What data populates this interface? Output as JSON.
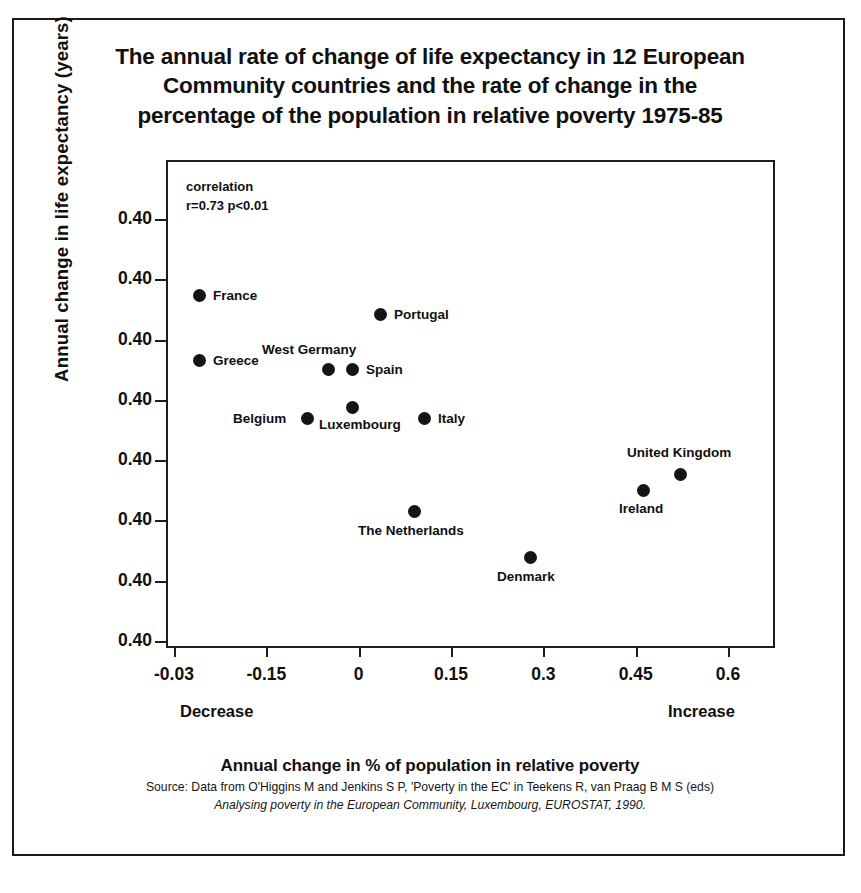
{
  "chart_data": {
    "type": "scatter",
    "title": "The annual rate of change of life expectancy in 12 European Community countries and the rate of change in the percentage of the population in relative poverty 1975-85",
    "title_lines": [
      "The annual rate of change of life expectancy in 12 European",
      "Community countries and the rate of change in the",
      "percentage of the population in relative poverty 1975-85"
    ],
    "xlabel": "Annual change in % of population in relative poverty",
    "ylabel": "Annual change in life expectancy (years)",
    "xlim": [
      -0.3,
      0.6
    ],
    "ylim": [
      0,
      0.4
    ],
    "grid": false,
    "legend": null,
    "x_tick_labels": [
      "-0.03",
      "-0.15",
      "0",
      "0.15",
      "0.3",
      "0.45",
      "0.6"
    ],
    "x_tick_values": [
      -0.3,
      -0.15,
      0,
      0.15,
      0.3,
      0.45,
      0.6
    ],
    "y_tick_labels": [
      "0.40",
      "0.40",
      "0.40",
      "0.40",
      "0.40",
      "0.40",
      "0.40",
      "0.40"
    ],
    "x_direction_low": "Decrease",
    "x_direction_high": "Increase",
    "annotations": {
      "correlation_line1": "correlation",
      "correlation_line2": "r=0.73 p<0.01",
      "correlation_r": 0.73,
      "correlation_p": "p<0.01"
    },
    "points": [
      {
        "label": "France",
        "x": -0.222,
        "y": 0.321,
        "px": 199,
        "py": 295,
        "label_dx": 14,
        "label_dy": -6
      },
      {
        "label": "Greece",
        "x": -0.222,
        "y": 0.268,
        "px": 199,
        "py": 360,
        "label_dx": 14,
        "label_dy": -6
      },
      {
        "label": "Portugal",
        "x": 0.045,
        "y": 0.305,
        "px": 380,
        "py": 314,
        "label_dx": 14,
        "label_dy": -6
      },
      {
        "label": "West Germany",
        "x": -0.045,
        "y": 0.261,
        "px": 328,
        "py": 369,
        "label_dx": -66,
        "label_dy": -26
      },
      {
        "label": "Spain",
        "x": -0.009,
        "y": 0.261,
        "px": 352,
        "py": 369,
        "label_dx": 14,
        "label_dy": -6
      },
      {
        "label": "Belgium",
        "x": -0.075,
        "y": 0.221,
        "px": 307,
        "py": 418,
        "label_dx": -74,
        "label_dy": -6
      },
      {
        "label": "Luxembourg",
        "x": -0.009,
        "y": 0.221,
        "px": 352,
        "py": 407,
        "label_dx": -33,
        "label_dy": 11
      },
      {
        "label": "Italy",
        "x": 0.111,
        "y": 0.221,
        "px": 424,
        "py": 418,
        "label_dx": 14,
        "label_dy": -6
      },
      {
        "label": "United Kingdom",
        "x": 0.525,
        "y": 0.175,
        "px": 680,
        "py": 474,
        "label_dx": -53,
        "label_dy": -28
      },
      {
        "label": "Ireland",
        "x": 0.468,
        "y": 0.163,
        "px": 643,
        "py": 490,
        "label_dx": -24,
        "label_dy": 12
      },
      {
        "label": "The Netherlands",
        "x": 0.105,
        "y": 0.127,
        "px": 414,
        "py": 511,
        "label_dx": -56,
        "label_dy": 13
      },
      {
        "label": "Denmark",
        "x": 0.283,
        "y": 0.09,
        "px": 530,
        "py": 557,
        "label_dx": -33,
        "label_dy": 13
      }
    ]
  },
  "source": {
    "line1": "Source: Data from O'Higgins M and Jenkins S P, 'Poverty in the EC' in Teekens R, van Praag B M S (eds)",
    "line2": "Analysing poverty in the European Community, Luxembourg, EUROSTAT, 1990."
  }
}
